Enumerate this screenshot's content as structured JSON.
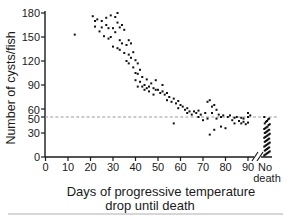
{
  "figure": {
    "background": "#ffffff",
    "text_color": "#1a1a1a",
    "point_color": "#111111",
    "reference_line_color": "#999999",
    "bottom_rule_color": "#b0b0b0"
  },
  "chart_data": {
    "type": "scatter",
    "title": "",
    "xlabel": "Days of progressive temperature drop until death",
    "xlabel_lines": [
      "Days of progressive temperature",
      "drop until death"
    ],
    "ylabel": "Number of cysts/fish",
    "x_ticks": [
      0,
      10,
      20,
      30,
      40,
      50,
      60,
      70,
      80,
      90
    ],
    "no_death_category": "No death",
    "no_death_lines": [
      "No",
      "death"
    ],
    "y_ticks": [
      0,
      30,
      50,
      60,
      90,
      120,
      150,
      180
    ],
    "xlim": [
      0,
      95
    ],
    "ylim": [
      0,
      180
    ],
    "grid": false,
    "legend": false,
    "reference_line_y": 50,
    "axis_break_between": [
      90,
      "No death"
    ],
    "points": [
      [
        13,
        153
      ],
      [
        21,
        176
      ],
      [
        22,
        170
      ],
      [
        22,
        163
      ],
      [
        23,
        172
      ],
      [
        24,
        157
      ],
      [
        25,
        170
      ],
      [
        25,
        162
      ],
      [
        26,
        151
      ],
      [
        27,
        174
      ],
      [
        27,
        165
      ],
      [
        28,
        161
      ],
      [
        28,
        148
      ],
      [
        29,
        177
      ],
      [
        29,
        150
      ],
      [
        30,
        161
      ],
      [
        30,
        138
      ],
      [
        31,
        175
      ],
      [
        31,
        156
      ],
      [
        32,
        180
      ],
      [
        32,
        168
      ],
      [
        32,
        136
      ],
      [
        33,
        162
      ],
      [
        33,
        146
      ],
      [
        33,
        134
      ],
      [
        34,
        165
      ],
      [
        34,
        142
      ],
      [
        35,
        159
      ],
      [
        35,
        130
      ],
      [
        36,
        140
      ],
      [
        36,
        120
      ],
      [
        37,
        146
      ],
      [
        37,
        128
      ],
      [
        37,
        117
      ],
      [
        38,
        142
      ],
      [
        38,
        124
      ],
      [
        39,
        131
      ],
      [
        39,
        112
      ],
      [
        40,
        121
      ],
      [
        40,
        105
      ],
      [
        40,
        96
      ],
      [
        41,
        117
      ],
      [
        41,
        104
      ],
      [
        41,
        88
      ],
      [
        42,
        109
      ],
      [
        42,
        94
      ],
      [
        43,
        100
      ],
      [
        43,
        88
      ],
      [
        44,
        90
      ],
      [
        44,
        84
      ],
      [
        45,
        86
      ],
      [
        45,
        97
      ],
      [
        46,
        88
      ],
      [
        46,
        82
      ],
      [
        47,
        92
      ],
      [
        48,
        86
      ],
      [
        48,
        78
      ],
      [
        49,
        96
      ],
      [
        49,
        84
      ],
      [
        50,
        84
      ],
      [
        51,
        80
      ],
      [
        52,
        82
      ],
      [
        52,
        90
      ],
      [
        53,
        78
      ],
      [
        54,
        80
      ],
      [
        54,
        71
      ],
      [
        55,
        75
      ],
      [
        56,
        69
      ],
      [
        57,
        73
      ],
      [
        57,
        42
      ],
      [
        58,
        67
      ],
      [
        59,
        61
      ],
      [
        59,
        70
      ],
      [
        60,
        65
      ],
      [
        61,
        63
      ],
      [
        62,
        59
      ],
      [
        63,
        61
      ],
      [
        63,
        55
      ],
      [
        64,
        57
      ],
      [
        65,
        53
      ],
      [
        66,
        57
      ],
      [
        67,
        55
      ],
      [
        68,
        50
      ],
      [
        68,
        58
      ],
      [
        69,
        53
      ],
      [
        70,
        46
      ],
      [
        71,
        55
      ],
      [
        72,
        48
      ],
      [
        72,
        69
      ],
      [
        73,
        71
      ],
      [
        73,
        28
      ],
      [
        74,
        63
      ],
      [
        74,
        55
      ],
      [
        75,
        65
      ],
      [
        75,
        34
      ],
      [
        76,
        59
      ],
      [
        76,
        48
      ],
      [
        77,
        53
      ],
      [
        78,
        50
      ],
      [
        78,
        38
      ],
      [
        79,
        52
      ],
      [
        80,
        36
      ],
      [
        81,
        50
      ],
      [
        82,
        52
      ],
      [
        83,
        46
      ],
      [
        84,
        49
      ],
      [
        84,
        42
      ],
      [
        85,
        50
      ],
      [
        86,
        45
      ],
      [
        87,
        42
      ],
      [
        87,
        49
      ],
      [
        88,
        44
      ],
      [
        88,
        48
      ],
      [
        89,
        41
      ],
      [
        90,
        43
      ],
      [
        90,
        50
      ],
      [
        90,
        55
      ],
      [
        91,
        52
      ]
    ],
    "no_death_values": [
      50,
      48,
      47,
      45,
      44,
      42,
      41,
      40,
      38,
      37,
      36,
      35,
      34,
      33,
      32,
      31,
      30,
      29,
      28,
      27,
      26,
      25,
      24,
      23,
      22,
      21,
      20,
      19,
      18,
      17,
      16,
      15,
      14,
      13,
      12,
      11,
      10,
      9,
      8,
      7,
      6,
      5,
      4,
      3,
      2
    ]
  }
}
